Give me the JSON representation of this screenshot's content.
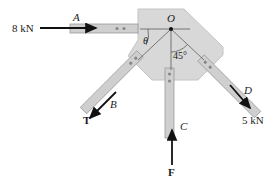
{
  "diagram": {
    "type": "statics-free-body",
    "point_label": "O",
    "members": [
      {
        "label": "A",
        "force": "8 kN",
        "direction": "horizontal, pointing right toward O"
      },
      {
        "label": "B",
        "force": "T",
        "direction": "down-left at angle theta from horizontal"
      },
      {
        "label": "C",
        "force": "F",
        "direction": "vertical, pointing up"
      },
      {
        "label": "D",
        "force": "5 kN",
        "direction": "down-right at 45 deg from vertical"
      }
    ],
    "angles": {
      "theta": "θ",
      "d_angle": "45°"
    }
  },
  "labels": {
    "force_a": "8 kN",
    "member_a": "A",
    "point_o": "O",
    "theta": "θ",
    "angle_45": "45°",
    "member_b": "B",
    "force_t": "T",
    "member_c": "C",
    "force_f": "F",
    "member_d": "D",
    "force_d": "5 kN"
  },
  "colors": {
    "plate": "#d6d6d6",
    "member": "#c9c9c9",
    "arrow": "#111111"
  }
}
